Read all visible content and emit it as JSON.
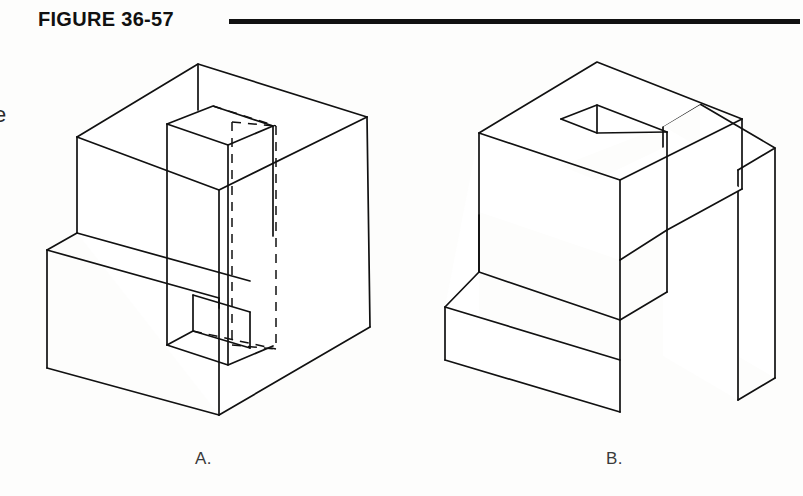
{
  "figure": {
    "title": "FIGURE 36-57",
    "rule_color": "#111111",
    "line_color": "#111111",
    "background_color": "#fdfdfc",
    "cropped_margin_text": "e",
    "captions": {
      "a": "A.",
      "b": "B."
    },
    "subfigures": [
      {
        "label": "A.",
        "kind": "isometric wireframe cube with hidden-line rectangular through slot",
        "line_style": "solid visible edges plus dashed hidden edges"
      },
      {
        "label": "B.",
        "kind": "isometric solid block, C-shaped with stepped front and vertical slot",
        "line_style": "solid visible edges only"
      }
    ]
  },
  "geometry": {
    "cube_a": {
      "top_back": [
        198,
        64
      ],
      "top_left": [
        77,
        137
      ],
      "top_right": [
        367,
        117
      ],
      "top_front": [
        219,
        190
      ],
      "left_bottom": [
        77,
        233
      ],
      "right_bottom": [
        370,
        327
      ],
      "front_bottom": [
        219,
        415
      ],
      "ledge_left_top": [
        47,
        250
      ],
      "ledge_left_bottom": [
        47,
        368
      ]
    },
    "slot_a": {
      "top_back": [
        213,
        106
      ],
      "top_left": [
        167,
        124
      ],
      "top_right": [
        273,
        126
      ],
      "top_front": [
        228,
        145
      ],
      "hidden_vertical_left_x": 232,
      "hidden_vertical_right_x": 276,
      "hidden_span_y": [
        122,
        345
      ]
    },
    "block_b": {
      "top_apex": [
        597,
        62
      ],
      "top_left": [
        479,
        133
      ],
      "right_outer_top": [
        775,
        148
      ],
      "front_step_left": [
        445,
        307
      ],
      "front_corner": [
        620,
        412
      ],
      "right_arm_left_x": 738,
      "right_arm_right_x": 775
    }
  }
}
